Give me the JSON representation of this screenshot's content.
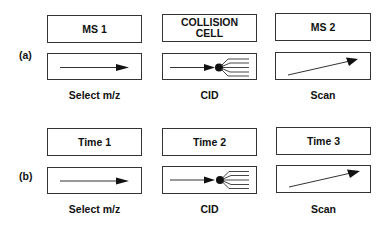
{
  "panels": [
    {
      "row_label": "(a)",
      "stages": [
        {
          "title": "MS 1",
          "caption": "Select m/z",
          "icon": "straight-arrow"
        },
        {
          "title": "COLLISION CELL",
          "title_lines": [
            "COLLISION",
            "CELL"
          ],
          "caption": "CID",
          "icon": "fragmentation-arrow"
        },
        {
          "title": "MS 2",
          "caption": "Scan",
          "icon": "diagonal-arrow"
        }
      ]
    },
    {
      "row_label": "(b)",
      "stages": [
        {
          "title": "Time 1",
          "caption": "Select m/z",
          "icon": "straight-arrow"
        },
        {
          "title": "Time 2",
          "caption": "CID",
          "icon": "fragmentation-arrow"
        },
        {
          "title": "Time 3",
          "caption": "Scan",
          "icon": "diagonal-arrow"
        }
      ]
    }
  ],
  "colors": {
    "line": "#333333",
    "fill": "#111111",
    "background": "#ffffff"
  }
}
